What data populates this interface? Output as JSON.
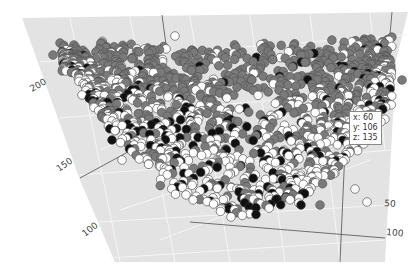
{
  "chart_data": {
    "type": "scatter",
    "subtype": "3d-scatter",
    "title": "",
    "axes": {
      "x": {
        "label": "",
        "ticks": [
          "50",
          "100"
        ]
      },
      "y": {
        "label": "",
        "ticks": [
          "100",
          "150",
          "200"
        ]
      },
      "z": {
        "label": "",
        "ticks": []
      }
    },
    "tick_positions": [
      {
        "text": "200",
        "x": 32,
        "y": 92,
        "angle": -30
      },
      {
        "text": "150",
        "x": 59,
        "y": 172,
        "angle": -35
      },
      {
        "text": "100",
        "x": 85,
        "y": 237,
        "angle": -38
      },
      {
        "text": "50",
        "x": 384,
        "y": 206,
        "angle": 5
      },
      {
        "text": "100",
        "x": 386,
        "y": 235,
        "angle": 5
      }
    ],
    "series": [
      {
        "name": "group-gray",
        "color": "#7a7a7a",
        "stroke": "#555555",
        "share": 0.52
      },
      {
        "name": "group-white",
        "color": "#ffffff",
        "stroke": "#555555",
        "share": 0.4
      },
      {
        "name": "group-black",
        "color": "#111111",
        "stroke": "#333333",
        "share": 0.08
      }
    ],
    "point_count": 1600,
    "point_radius": 4.3,
    "grid": true,
    "legend": false,
    "hover_point": {
      "x": 60,
      "y": 106,
      "z": 135
    }
  },
  "tooltip": {
    "x_line": "x: 60",
    "y_line": "y: 106",
    "z_line": "z: 135",
    "left": 349,
    "top": 111
  },
  "colors": {
    "plane": "#e3e3e3",
    "grid": "#f6f6f6",
    "axis_line": "#6e6e6e",
    "background": "#ffffff"
  }
}
